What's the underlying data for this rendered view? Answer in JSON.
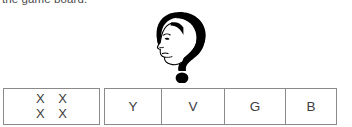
{
  "caption": {
    "text": "the game board."
  },
  "illustration": {
    "name": "question-mark-head-silhouette",
    "description": "black silhouette of a woman's head in profile whose hair forms a question mark hook, with a round dot beneath",
    "fill_color": "#000000"
  },
  "board": {
    "score_cell": {
      "rows": [
        "X X",
        "X X"
      ]
    },
    "letter_cells": [
      {
        "label": "Y"
      },
      {
        "label": "V"
      },
      {
        "label": "G"
      },
      {
        "label": "B"
      }
    ],
    "border_color": "#8a8a8a",
    "text_color": "#3d3d3d"
  }
}
